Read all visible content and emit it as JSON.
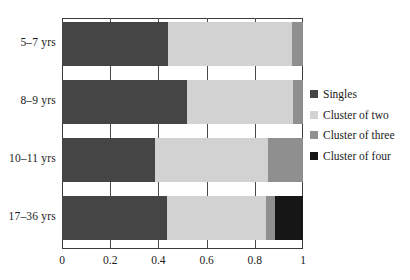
{
  "chart_data": {
    "type": "bar",
    "orientation": "horizontal",
    "stacked": true,
    "normalized": true,
    "title": "",
    "xlabel": "",
    "ylabel": "",
    "xlim": [
      0,
      1
    ],
    "grid": true,
    "legend_position": "right",
    "categories": [
      "5–7 yrs",
      "8–9 yrs",
      "10–11 yrs",
      "17–36 yrs"
    ],
    "xticks": [
      0,
      0.2,
      0.4,
      0.6,
      0.8,
      1
    ],
    "xticklabels": [
      "0",
      "0.2",
      "0.4",
      "0.6",
      "0.8",
      "1"
    ],
    "series": [
      {
        "name": "Singles",
        "color": "#454545",
        "values": [
          0.44,
          0.52,
          0.385,
          0.435
        ]
      },
      {
        "name": "Cluster of two",
        "color": "#d2d2d2",
        "values": [
          0.515,
          0.44,
          0.47,
          0.41
        ]
      },
      {
        "name": "Cluster of three",
        "color": "#8f8f8f",
        "values": [
          0.045,
          0.04,
          0.145,
          0.04
        ]
      },
      {
        "name": "Cluster of four",
        "color": "#161616",
        "values": [
          0.0,
          0.0,
          0.0,
          0.115
        ]
      }
    ]
  },
  "legend": {
    "items": [
      {
        "label": "Singles",
        "color": "#454545"
      },
      {
        "label": "Cluster of two",
        "color": "#d2d2d2"
      },
      {
        "label": "Cluster of three",
        "color": "#8f8f8f"
      },
      {
        "label": "Cluster of four",
        "color": "#161616"
      }
    ]
  },
  "axis": {
    "tick_color": "#3a3a3a",
    "text_color": "#1b1b1b"
  }
}
